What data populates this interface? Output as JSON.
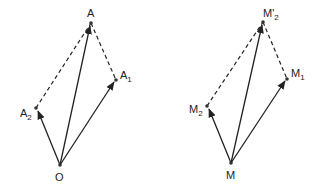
{
  "diagrams": [
    {
      "name": "left",
      "points": {
        "origin": {
          "label": "O",
          "x": 60,
          "y": 165
        },
        "A": {
          "label": "A",
          "x": 91,
          "y": 23
        },
        "A1": {
          "label": "A",
          "sub": "1",
          "x": 116,
          "y": 80
        },
        "A2": {
          "label": "A",
          "sub": "2",
          "x": 36,
          "y": 108
        }
      }
    },
    {
      "name": "right",
      "points": {
        "origin": {
          "label": "M",
          "x": 231,
          "y": 163
        },
        "M2p": {
          "label": "M'",
          "sub": "2",
          "x": 263,
          "y": 22
        },
        "M1": {
          "label": "M",
          "sub": "1",
          "x": 287,
          "y": 79
        },
        "M2": {
          "label": "M",
          "sub": "2",
          "x": 207,
          "y": 106
        }
      }
    }
  ],
  "colors": {
    "line": "#222222",
    "background": "#ffffff"
  }
}
